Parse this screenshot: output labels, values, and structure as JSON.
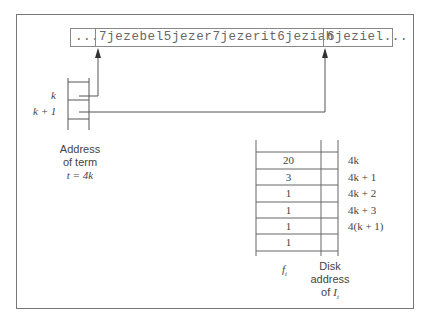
{
  "diagram": {
    "string_segments": {
      "prefix": "...",
      "main": "7jezebel5jezer7jezerit6jeziah",
      "next": "6jeziel..."
    },
    "pointer_labels": {
      "k": "k",
      "k_plus_1": "k + 1"
    },
    "pointer_caption": {
      "line1": "Address",
      "line2": "of term",
      "line3": "t = 4k"
    },
    "table": {
      "rows": [
        {
          "ft": "20",
          "addr": "4k"
        },
        {
          "ft": "3",
          "addr": "4k + 1"
        },
        {
          "ft": "1",
          "addr": "4k + 2"
        },
        {
          "ft": "1",
          "addr": "4k + 3"
        },
        {
          "ft": "1",
          "addr": "4(k + 1)"
        },
        {
          "ft": "1",
          "addr": ""
        }
      ],
      "col1_label": "f",
      "col1_sub": "t",
      "col2_label_line1": "Disk",
      "col2_label_line2": "address",
      "col2_label_line3_prefix": "of ",
      "col2_label_line3_var": "I",
      "col2_label_line3_sub": "t"
    }
  }
}
